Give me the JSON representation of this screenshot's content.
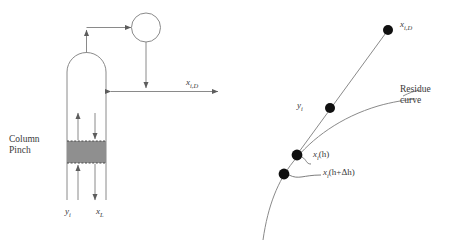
{
  "figure": {
    "background_color": "#ffffff",
    "stroke_color": "#6b6b6b",
    "text_color": "#3a3a3a",
    "marker_color": "#101010",
    "pinch_fill_color": "#8f8f8f"
  },
  "left_diagram": {
    "name": "distillation-column-schematic",
    "column_pinch_label_line1": "Column",
    "column_pinch_label_line2": "Pinch",
    "distillate_label": {
      "symbol": "x",
      "subscript": "i,D"
    },
    "vapor_stream_label": {
      "symbol": "y",
      "subscript": "i"
    },
    "liquid_stream_label": {
      "symbol": "x",
      "subscript": "L"
    },
    "components": [
      "column-body",
      "column-dome",
      "condenser",
      "vapor-line",
      "reflux-line",
      "distillate-line",
      "pinch-zone",
      "internal-vapor-arrow",
      "internal-liquid-arrow",
      "feed-vapor-arrow",
      "bottoms-liquid-arrow"
    ]
  },
  "right_diagram": {
    "name": "residue-curve-plot",
    "residue_curve_label_line1": "Residue",
    "residue_curve_label_line2": "curve",
    "points": [
      {
        "name": "distillate-point",
        "symbol": "x",
        "subscript": "i,D",
        "x": 388,
        "y": 30
      },
      {
        "name": "vapor-point",
        "symbol": "y",
        "subscript": "i",
        "x": 330,
        "y": 108
      },
      {
        "name": "liquid-point-h",
        "symbol": "x",
        "subscript": "i",
        "argument": "(h)",
        "x": 297,
        "y": 155
      },
      {
        "name": "liquid-point-h-plus-dh",
        "symbol": "x",
        "subscript": "i",
        "argument": "(h+Δh)",
        "x": 284,
        "y": 174
      }
    ],
    "annotations": {
      "xi_h": "(h)",
      "xi_h_plus_dh": "(h+Δh)"
    }
  }
}
